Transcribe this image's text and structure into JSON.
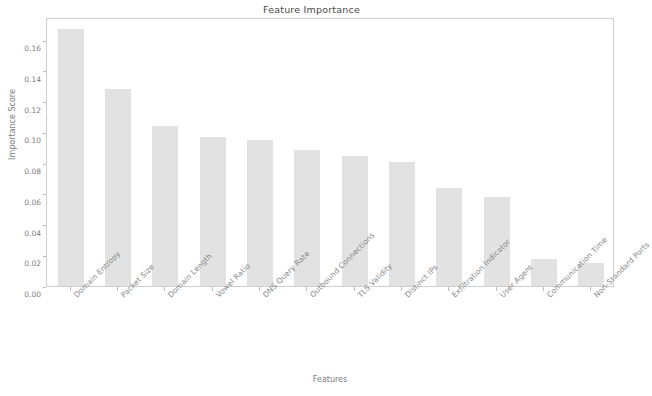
{
  "chart_data": {
    "type": "bar",
    "title": "Feature Importance",
    "xlabel": "Features",
    "ylabel": "Importance Score",
    "categories": [
      "Domain Entropy",
      "Packet Size",
      "Domain Length",
      "Vowel Ratio",
      "DNS Query Rate",
      "Outbound Connections",
      "TLS Validity",
      "Distinct IPs",
      "Exfiltration Indicator",
      "User Agent",
      "Communication Time",
      "Non-Standard Ports"
    ],
    "values": [
      0.167,
      0.128,
      0.104,
      0.097,
      0.095,
      0.0885,
      0.0845,
      0.081,
      0.0635,
      0.058,
      0.0175,
      0.015
    ],
    "ylim": [
      0.0,
      0.175
    ],
    "yticks": [
      0.0,
      0.02,
      0.04,
      0.06,
      0.08,
      0.1,
      0.12,
      0.14,
      0.16
    ],
    "ytick_labels": [
      "0.00",
      "0.02",
      "0.04",
      "0.06",
      "0.08",
      "0.10",
      "0.12",
      "0.14",
      "0.16"
    ],
    "grid": false,
    "legend": "none",
    "bar_color": "#dedede",
    "text_color": "#7c7c7c",
    "axis_color": "#cfcfcf",
    "background": "#ffffff"
  }
}
